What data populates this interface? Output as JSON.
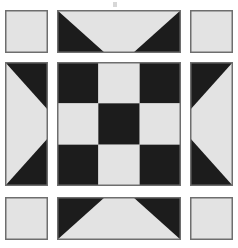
{
  "figure": {
    "name": "quilt-block-pattern",
    "width": 238,
    "height": 248,
    "background_color": "#ffffff"
  },
  "palette": {
    "dark": "#1c1c1c",
    "light": "#e3e3e3",
    "border": "#6e6e6e",
    "background": "#ffffff",
    "smudge": "#c9c9c9"
  },
  "layout": {
    "columns": 3,
    "rows": 3,
    "col_x": [
      5,
      57,
      190
    ],
    "col_w": [
      43,
      124,
      43
    ],
    "row_y": [
      10,
      62,
      197
    ],
    "row_h": [
      43,
      124,
      43
    ]
  },
  "blocks": [
    {
      "id": "corner-top-left",
      "label": "Plain light square",
      "type": "plain",
      "fill": "light",
      "row": 0,
      "col": 0
    },
    {
      "id": "edge-top",
      "label": "Flying geese, points down",
      "type": "flying-geese",
      "orientation": "down",
      "row": 0,
      "col": 1
    },
    {
      "id": "corner-top-right",
      "label": "Plain light square",
      "type": "plain",
      "fill": "light",
      "row": 0,
      "col": 2
    },
    {
      "id": "edge-left",
      "label": "Flying geese, points right",
      "type": "flying-geese",
      "orientation": "right",
      "row": 1,
      "col": 0
    },
    {
      "id": "center-nine-patch",
      "label": "Nine patch checkerboard",
      "type": "nine-patch",
      "row": 1,
      "col": 1,
      "patches": [
        "dark",
        "light",
        "dark",
        "light",
        "dark",
        "light",
        "dark",
        "light",
        "dark"
      ]
    },
    {
      "id": "edge-right",
      "label": "Flying geese, points left",
      "type": "flying-geese",
      "orientation": "left",
      "row": 1,
      "col": 2
    },
    {
      "id": "corner-bottom-left",
      "label": "Plain light square",
      "type": "plain",
      "fill": "light",
      "row": 2,
      "col": 0
    },
    {
      "id": "edge-bottom",
      "label": "Flying geese, points up",
      "type": "flying-geese",
      "orientation": "up",
      "row": 2,
      "col": 1
    },
    {
      "id": "corner-bottom-right",
      "label": "Plain light square",
      "type": "plain",
      "fill": "light",
      "row": 2,
      "col": 2
    }
  ],
  "artifacts": [
    {
      "id": "scan-smudge",
      "x": 113,
      "y": 2,
      "width": 4,
      "height": 5
    }
  ]
}
